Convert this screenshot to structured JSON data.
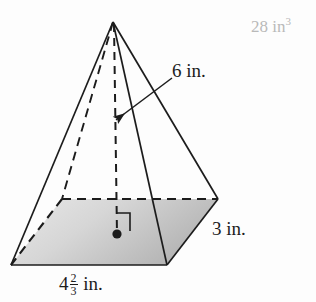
{
  "figure": {
    "type": "rectangular-pyramid-diagram",
    "background_color": "#fdfdfd",
    "stroke_color": "#1c1c1c",
    "base_fill_light": "#e4e4e4",
    "base_fill_dark": "#b8b8b8"
  },
  "labels": {
    "slant_height": "6 in.",
    "depth": "3 in.",
    "width_whole": "4",
    "width_numerator": "2",
    "width_denominator": "3",
    "width_unit": "in."
  },
  "answer": {
    "value": "28 in",
    "exponent": "3",
    "color": "#b9b9b9"
  },
  "geometry": {
    "apex": [
      113,
      22
    ],
    "base_back_left": [
      62,
      199
    ],
    "base_back_right": [
      218,
      199
    ],
    "base_front_right": [
      167,
      265
    ],
    "base_front_left": [
      11,
      265
    ],
    "center_dot": [
      117,
      234
    ],
    "leader_arrow_tip": [
      115,
      121
    ],
    "leader_arrow_tail": [
      172,
      78
    ]
  },
  "markers": {
    "center_dot_name": "base-center-point",
    "right_angle_name": "right-angle-marker"
  }
}
